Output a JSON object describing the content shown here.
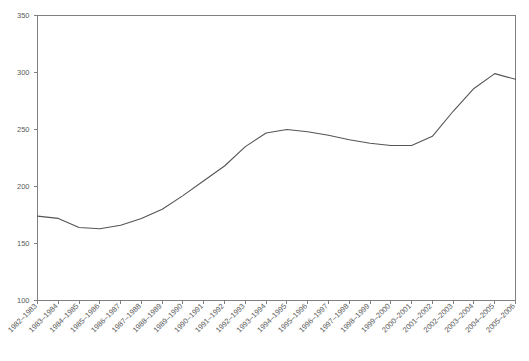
{
  "chart_data": {
    "type": "line",
    "title": "",
    "subtitle": "",
    "xlabel": "",
    "ylabel": "",
    "grid": false,
    "legend": false,
    "legend_position": "none",
    "xlim_categories": [
      "1982–1983",
      "2005–2006"
    ],
    "ylim": [
      100,
      350
    ],
    "ytick_step": 50,
    "yticks": [
      100,
      150,
      200,
      250,
      300,
      350
    ],
    "ytick_labels": [
      "100",
      "150",
      "200",
      "250",
      "300",
      "350"
    ],
    "categories": [
      "1982–1983",
      "1983–1984",
      "1984–1985",
      "1985–1986",
      "1986–1987",
      "1987–1988",
      "1988–1989",
      "1989–1990",
      "1990–1991",
      "1991–1992",
      "1992–1993",
      "1993–1994",
      "1994–1995",
      "1995–1996",
      "1996–1997",
      "1997–1998",
      "1998–1999",
      "1999–2000",
      "2000–2001",
      "2001–2002",
      "2002–2003",
      "2003–2004",
      "2004–2005",
      "2005–2006"
    ],
    "values": [
      174,
      172,
      164,
      163,
      166,
      172,
      180,
      192,
      205,
      218,
      235,
      247,
      250,
      248,
      245,
      241,
      238,
      236,
      236,
      244,
      266,
      286,
      299,
      294
    ],
    "series": [
      {
        "name": "series-1",
        "color": "#555555",
        "values": [
          174,
          172,
          164,
          163,
          166,
          172,
          180,
          192,
          205,
          218,
          235,
          247,
          250,
          248,
          245,
          241,
          238,
          236,
          236,
          244,
          266,
          286,
          299,
          294
        ]
      }
    ]
  },
  "style": {
    "axis_color": "#808080",
    "line_color": "#555555",
    "label_color": "#5a5a5a",
    "background": "#ffffff"
  }
}
